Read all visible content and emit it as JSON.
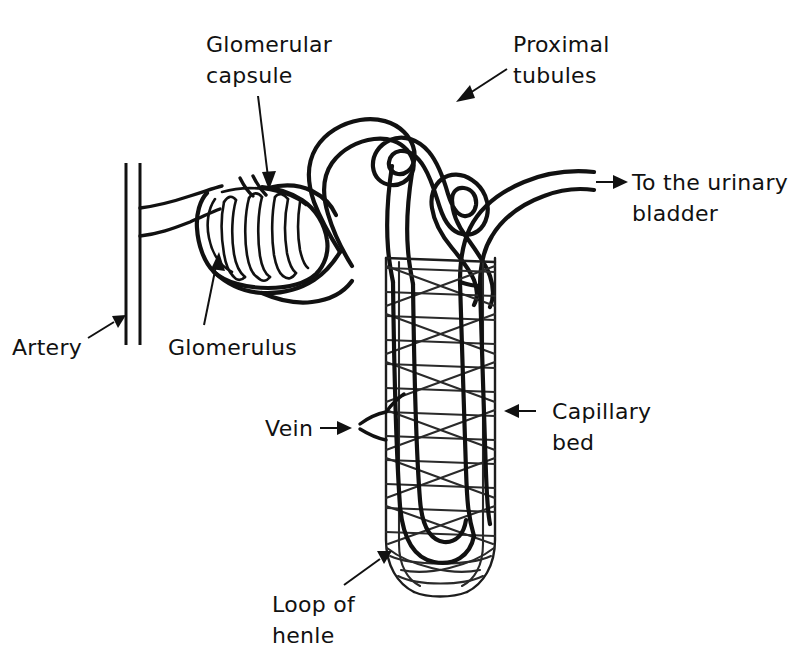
{
  "figure": {
    "background_color": "#ffffff",
    "ink_color": "#111111",
    "style": "hand-drawn line art, black ink on white"
  },
  "labels": {
    "glomerular_capsule": {
      "line1": "Glomerular",
      "line2": "capsule",
      "points_to": "glomerular-capsule",
      "arrow_direction": "down"
    },
    "proximal_tubules": {
      "line1": "Proximal",
      "line2": "tubules",
      "points_to": "proximal-tubule",
      "arrow_direction": "down-left"
    },
    "to_the_urinary_bladder": {
      "line1": "To the urinary",
      "line2": "bladder",
      "points_to": "collecting-duct-outlet",
      "arrow_direction": "right"
    },
    "artery": {
      "line1": "Artery",
      "points_to": "artery",
      "arrow_direction": "up-right"
    },
    "glomerulus": {
      "line1": "Glomerulus",
      "points_to": "glomerulus",
      "arrow_direction": "up"
    },
    "vein": {
      "line1": "Vein",
      "points_to": "vein",
      "arrow_direction": "right"
    },
    "capillary_bed": {
      "line1": "Capillary",
      "line2": "bed",
      "points_to": "capillary-bed",
      "arrow_direction": "left"
    },
    "loop_of_henle": {
      "line1": "Loop of",
      "line2": "henle",
      "points_to": "loop-of-henle",
      "arrow_direction": "up-right"
    }
  },
  "structures": [
    {
      "name": "artery",
      "description": "vertical double-line blood vessel on the left with a branch to the glomerulus"
    },
    {
      "name": "glomerular-capsule",
      "description": "Bowman's capsule surrounding the glomerulus"
    },
    {
      "name": "glomerulus",
      "description": "tuft of capillary loops inside the capsule"
    },
    {
      "name": "proximal-tubule",
      "description": "convoluted tube looping above the capillary bed"
    },
    {
      "name": "capillary-bed",
      "description": "mesh of crossing capillaries wrapping the loop of Henle"
    },
    {
      "name": "loop-of-henle",
      "description": "U-shaped tube descending to the bottom of the capillary bed"
    },
    {
      "name": "vein",
      "description": "vessel leaving the left side of the capillary bed"
    },
    {
      "name": "collecting-duct-outlet",
      "description": "tube leaving to the top right toward the urinary bladder"
    }
  ]
}
